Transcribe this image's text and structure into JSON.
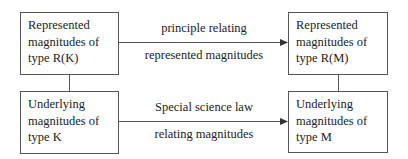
{
  "diagram": {
    "boxes": {
      "top_left": {
        "lines": [
          "Represented",
          "magnitudes of",
          "type R(K)"
        ]
      },
      "top_right": {
        "lines": [
          "Represented",
          "magnitudes of",
          "type R(M)"
        ]
      },
      "bottom_left": {
        "lines": [
          "Underlying",
          "magnitudes of",
          "type K"
        ]
      },
      "bottom_right": {
        "lines": [
          "Underlying",
          "magnitudes of",
          "type M"
        ]
      }
    },
    "arrows": {
      "top": {
        "label_above": "principle relating",
        "label_below": "represented magnitudes"
      },
      "bottom": {
        "label_above": "Special science law",
        "label_below": "relating magnitudes"
      }
    },
    "colors": {
      "line": "#555555",
      "text": "#222222",
      "background": "#ffffff"
    }
  }
}
